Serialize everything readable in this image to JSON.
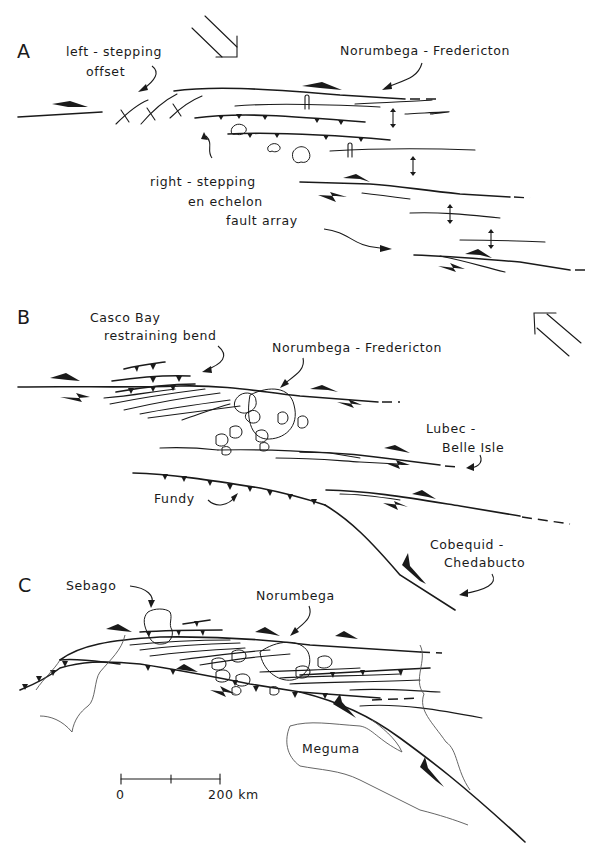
{
  "figure": {
    "panels": [
      {
        "id": "A",
        "letter": "A",
        "labels": {
          "left_stepping_line1": "left - stepping",
          "left_stepping_line2": "offset",
          "norumbega_fredericton": "Norumbega - Fredericton",
          "right_stepping_line1": "right - stepping",
          "right_stepping_line2": "en echelon",
          "right_stepping_line3": "fault array"
        },
        "compression_arrow": "southeast-pointing double-line arrow"
      },
      {
        "id": "B",
        "letter": "B",
        "labels": {
          "casco_bay_line1": "Casco Bay",
          "casco_bay_line2": "restraining bend",
          "norumbega_fredericton": "Norumbega - Fredericton",
          "lubec_line1": "Lubec -",
          "lubec_line2": "Belle Isle",
          "fundy": "Fundy",
          "cobequid_line1": "Cobequid -",
          "cobequid_line2": "Chedabucto"
        },
        "compression_arrow": "northwest-pointing double-line arrow"
      },
      {
        "id": "C",
        "letter": "C",
        "labels": {
          "sebago": "Sebago",
          "norumbega": "Norumbega",
          "meguma": "Meguma"
        },
        "scale_bar": {
          "start_label": "0",
          "end_label": "200 km"
        }
      }
    ],
    "colors": {
      "ink": "#1a1a1a",
      "background": "#ffffff",
      "coastline": "#555555"
    }
  }
}
